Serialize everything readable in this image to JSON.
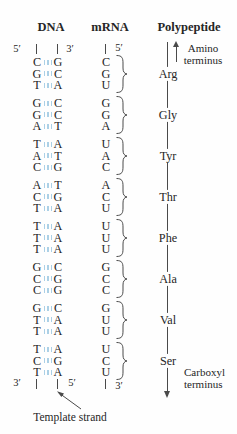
{
  "headers": {
    "dna": "DNA",
    "mrna": "mRNA",
    "polypeptide": "Polypeptide"
  },
  "dna_strands": {
    "left_top_end": "5′",
    "right_top_end": "3′",
    "left_bottom_end": "3′",
    "right_bottom_end": "5′"
  },
  "mrna_strand": {
    "top_end": "5′",
    "bottom_end": "3′"
  },
  "polypeptide": {
    "amino_terminus": "Amino terminus",
    "carboxyl_terminus": "Carboxyl terminus"
  },
  "template_strand_label": "Template strand",
  "codons": [
    {
      "dna_pairs": [
        [
          "C",
          "G"
        ],
        [
          "G",
          "C"
        ],
        [
          "T",
          "A"
        ]
      ],
      "mrna": [
        "C",
        "G",
        "U"
      ],
      "amino_acid": "Arg"
    },
    {
      "dna_pairs": [
        [
          "G",
          "C"
        ],
        [
          "G",
          "C"
        ],
        [
          "A",
          "T"
        ]
      ],
      "mrna": [
        "G",
        "G",
        "A"
      ],
      "amino_acid": "Gly"
    },
    {
      "dna_pairs": [
        [
          "T",
          "A"
        ],
        [
          "A",
          "T"
        ],
        [
          "C",
          "G"
        ]
      ],
      "mrna": [
        "U",
        "A",
        "C"
      ],
      "amino_acid": "Tyr"
    },
    {
      "dna_pairs": [
        [
          "A",
          "T"
        ],
        [
          "C",
          "G"
        ],
        [
          "T",
          "A"
        ]
      ],
      "mrna": [
        "A",
        "C",
        "U"
      ],
      "amino_acid": "Thr"
    },
    {
      "dna_pairs": [
        [
          "T",
          "A"
        ],
        [
          "T",
          "A"
        ],
        [
          "T",
          "A"
        ]
      ],
      "mrna": [
        "U",
        "U",
        "U"
      ],
      "amino_acid": "Phe"
    },
    {
      "dna_pairs": [
        [
          "G",
          "C"
        ],
        [
          "C",
          "G"
        ],
        [
          "C",
          "G"
        ]
      ],
      "mrna": [
        "G",
        "C",
        "C"
      ],
      "amino_acid": "Ala"
    },
    {
      "dna_pairs": [
        [
          "G",
          "C"
        ],
        [
          "T",
          "A"
        ],
        [
          "T",
          "A"
        ]
      ],
      "mrna": [
        "G",
        "U",
        "U"
      ],
      "amino_acid": "Val"
    },
    {
      "dna_pairs": [
        [
          "T",
          "A"
        ],
        [
          "C",
          "G"
        ],
        [
          "T",
          "A"
        ]
      ],
      "mrna": [
        "U",
        "C",
        "U"
      ],
      "amino_acid": "Ser"
    }
  ],
  "colors": {
    "hydrogen_bond": "#abd0e6",
    "ink": "#262626",
    "line": "#4a4a4a"
  }
}
